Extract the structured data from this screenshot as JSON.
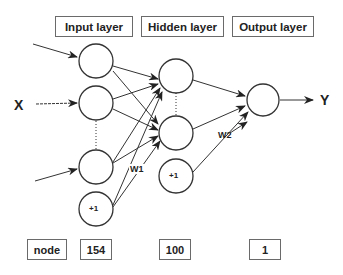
{
  "diagram": {
    "title_boxes": {
      "input": "Input layer",
      "hidden": "Hidden layer",
      "output": "Output layer"
    },
    "input_label": "X",
    "output_label": "Y",
    "bias_label": "+1",
    "weights": {
      "w1": "W1",
      "w2": "W2"
    },
    "node_counts": {
      "header": "node",
      "input": "154",
      "hidden": "100",
      "output": "1"
    }
  }
}
